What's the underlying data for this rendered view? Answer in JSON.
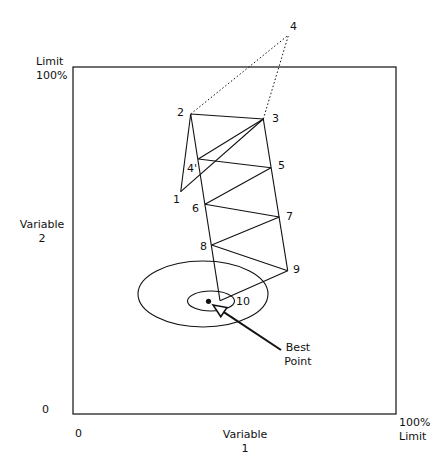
{
  "diagram": {
    "type": "simplex-optimization-path",
    "frame": {
      "x": 73,
      "y": 67,
      "width": 323,
      "height": 347
    },
    "colors": {
      "line": "#111111",
      "background": "#ffffff"
    },
    "y_axis": {
      "top_label_line1": "Limit",
      "top_label_line2": "100%",
      "title_line1": "Variable",
      "title_line2": "2",
      "origin_label": "0"
    },
    "x_axis": {
      "origin_label": "0",
      "title_line1": "Variable",
      "title_line2": "1",
      "right_label_line1": "100%",
      "right_label_line2": "Limit"
    },
    "points": [
      {
        "id": "1",
        "label": "1",
        "x": 180.7,
        "y": 191.7,
        "lx": 173,
        "ly": 194
      },
      {
        "id": "2",
        "label": "2",
        "x": 190.7,
        "y": 114.0,
        "lx": 177,
        "ly": 107
      },
      {
        "id": "3",
        "label": "3",
        "x": 263.3,
        "y": 119.0,
        "lx": 272,
        "ly": 113
      },
      {
        "id": "4",
        "label": "4",
        "x": 288.5,
        "y": 35.0,
        "lx": 290,
        "ly": 21
      },
      {
        "id": "4p",
        "label": "4'",
        "x": 198.3,
        "y": 159.0,
        "lx": 187,
        "ly": 163
      },
      {
        "id": "5",
        "label": "5",
        "x": 271.0,
        "y": 167.7,
        "lx": 278,
        "ly": 160
      },
      {
        "id": "6",
        "label": "6",
        "x": 205.0,
        "y": 204.3,
        "lx": 192,
        "ly": 203
      },
      {
        "id": "7",
        "label": "7",
        "x": 279.3,
        "y": 217.0,
        "lx": 286,
        "ly": 211
      },
      {
        "id": "8",
        "label": "8",
        "x": 211.7,
        "y": 245.0,
        "lx": 200,
        "ly": 241
      },
      {
        "id": "9",
        "label": "9",
        "x": 287.7,
        "y": 270.7,
        "lx": 293,
        "ly": 264
      },
      {
        "id": "10",
        "label": "10",
        "x": 220.0,
        "y": 300.7,
        "lx": 236,
        "ly": 296
      }
    ],
    "solid_segments": [
      [
        "1",
        "2"
      ],
      [
        "2",
        "3"
      ],
      [
        "3",
        "1"
      ],
      [
        "3",
        "4p"
      ],
      [
        "4p",
        "5"
      ],
      [
        "5",
        "6"
      ],
      [
        "6",
        "7"
      ],
      [
        "7",
        "8"
      ],
      [
        "8",
        "9"
      ],
      [
        "9",
        "10"
      ],
      [
        "2",
        "10"
      ],
      [
        "3",
        "9"
      ]
    ],
    "dotted_segments": [
      [
        "2",
        "4"
      ],
      [
        "3",
        "4"
      ]
    ],
    "contours": [
      {
        "name": "outer-contour",
        "cx": 203,
        "cy": 294,
        "rx": 65,
        "ry": 33
      },
      {
        "name": "inner-contour",
        "cx": 211,
        "cy": 301,
        "rx": 23.5,
        "ry": 10
      }
    ],
    "best_point": {
      "x": 208.5,
      "y": 301.3,
      "label_line1": "Best",
      "label_line2": "Point",
      "arrow": {
        "from_x": 281,
        "from_y": 350,
        "to_x": 213,
        "to_y": 305
      }
    }
  }
}
